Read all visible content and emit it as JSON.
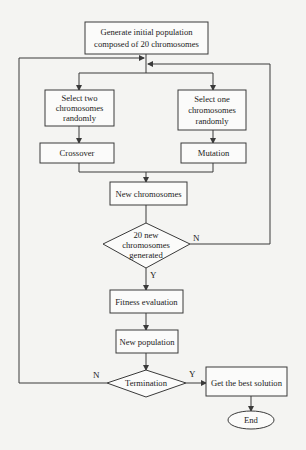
{
  "flowchart": {
    "nodes": {
      "init": {
        "line1": "Generate initial population",
        "line2": "composed of 20 chromosomes"
      },
      "select_two": {
        "line1": "Select two",
        "line2": "chromosomes",
        "line3": "randomly"
      },
      "select_one": {
        "line1": "Select one",
        "line2": "chromosomes",
        "line3": "randomly"
      },
      "crossover": {
        "label": "Crossover"
      },
      "mutation": {
        "label": "Mutation"
      },
      "new_chromosomes": {
        "label": "New chromosomes"
      },
      "decision_generated": {
        "line1": "20 new",
        "line2": "chromosomes",
        "line3": "generated"
      },
      "fitness": {
        "label": "Fitness evaluation"
      },
      "new_population": {
        "label": "New population"
      },
      "termination": {
        "label": "Termination"
      },
      "best_solution": {
        "label": "Get the best solution"
      },
      "end": {
        "label": "End"
      }
    },
    "edge_labels": {
      "generated_no": "N",
      "generated_yes": "Y",
      "termination_no": "N",
      "termination_yes": "Y"
    }
  }
}
